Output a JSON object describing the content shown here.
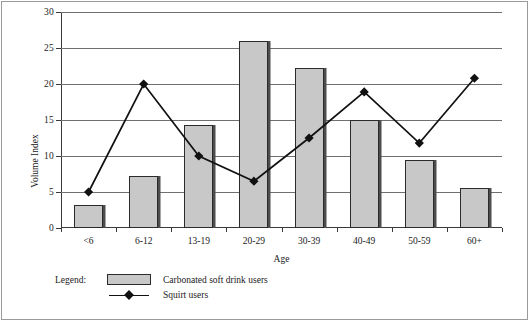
{
  "chart_data": {
    "type": "bar",
    "title": "",
    "xlabel": "Age",
    "ylabel": "Volume Index",
    "categories": [
      "<6",
      "6-12",
      "13-19",
      "20-29",
      "30-39",
      "40-49",
      "50-59",
      "60+"
    ],
    "ylim": [
      0,
      30
    ],
    "yticks": [
      0,
      5,
      10,
      15,
      20,
      25,
      30
    ],
    "ytick_labels": [
      "0",
      "5",
      "10",
      "15",
      "20",
      "25",
      "30"
    ],
    "grid": true,
    "legend_position": "bottom-left",
    "series": [
      {
        "name": "Carbonated soft drink users",
        "type": "bar",
        "color": "#c8c8c8",
        "values": [
          3.2,
          7.2,
          14.3,
          26.0,
          22.2,
          15.0,
          9.4,
          5.5
        ]
      },
      {
        "name": "Squirt users",
        "type": "line",
        "color": "#111111",
        "marker": "diamond",
        "values": [
          5.0,
          20.0,
          10.0,
          6.5,
          12.5,
          18.9,
          11.8,
          20.8
        ]
      }
    ]
  },
  "legend": {
    "title": "Legend:",
    "entries": [
      {
        "label": "Carbonated soft drink users",
        "marker": "swatch"
      },
      {
        "label": "Squirt users",
        "marker": "diamond-line"
      }
    ]
  }
}
